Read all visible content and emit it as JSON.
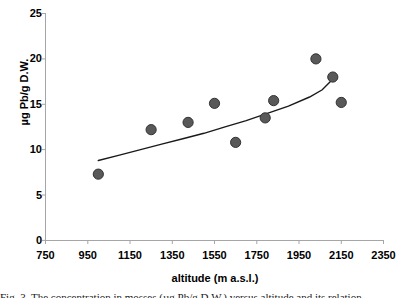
{
  "chart_data": {
    "type": "scatter",
    "title": "",
    "xlabel": "altitude (m a.s.l.)",
    "ylabel": "µg Pb/g D.W.",
    "xlim": [
      750,
      2350
    ],
    "ylim": [
      0,
      25
    ],
    "xticks": [
      750,
      950,
      1150,
      1350,
      1550,
      1750,
      1950,
      2150,
      2350
    ],
    "yticks": [
      0,
      5,
      10,
      15,
      20,
      25
    ],
    "grid": false,
    "legend": "none",
    "marker_color": "#595959",
    "marker_edge_color": "#333333",
    "trendline_color": "#1a1a1a",
    "axis_color": "#808080",
    "points": [
      {
        "x": 1000,
        "y": 7.3
      },
      {
        "x": 1250,
        "y": 12.2
      },
      {
        "x": 1425,
        "y": 13.0
      },
      {
        "x": 1550,
        "y": 15.1
      },
      {
        "x": 1650,
        "y": 10.8
      },
      {
        "x": 1790,
        "y": 13.5
      },
      {
        "x": 1830,
        "y": 15.4
      },
      {
        "x": 2030,
        "y": 20.0
      },
      {
        "x": 2110,
        "y": 18.0
      },
      {
        "x": 2150,
        "y": 15.2
      }
    ],
    "trendline": {
      "type": "power",
      "points": [
        {
          "x": 1000,
          "y": 8.8
        },
        {
          "x": 1100,
          "y": 9.4
        },
        {
          "x": 1200,
          "y": 10.0
        },
        {
          "x": 1300,
          "y": 10.6
        },
        {
          "x": 1400,
          "y": 11.2
        },
        {
          "x": 1500,
          "y": 11.8
        },
        {
          "x": 1600,
          "y": 12.5
        },
        {
          "x": 1700,
          "y": 13.2
        },
        {
          "x": 1800,
          "y": 14.0
        },
        {
          "x": 1900,
          "y": 14.8
        },
        {
          "x": 2000,
          "y": 15.8
        },
        {
          "x": 2060,
          "y": 16.6
        },
        {
          "x": 2120,
          "y": 18.0
        }
      ]
    }
  },
  "axes": {
    "y_tick_labels": [
      "25",
      "20",
      "15",
      "10",
      "5",
      "0"
    ],
    "x_tick_labels": [
      "750",
      "950",
      "1150",
      "1350",
      "1550",
      "1750",
      "1950",
      "2150",
      "2350"
    ],
    "y_title": "µg Pb/g D.W.",
    "x_title": "altitude (m a.s.l.)"
  },
  "caption": {
    "clipped_line": "Fig. 3. The concentration in mosses (µg Pb/g D.W.) versus altitude and its relation"
  }
}
